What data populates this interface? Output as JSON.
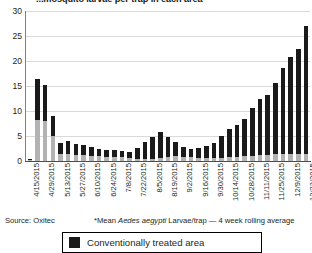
{
  "chart_data": {
    "type": "bar",
    "title": "...mosquito larvae per trap in each area",
    "subtitle": "",
    "xlabel": "",
    "ylabel": "",
    "ylim": [
      0,
      30
    ],
    "yticks": [
      0,
      5,
      10,
      15,
      20,
      25,
      30
    ],
    "grid": true,
    "stacked": true,
    "legend_position": "bottom",
    "bar_color_conventional": "#1a1a1a",
    "bar_color_treated": "#b3b3b3",
    "categories": [
      "4/15/2015",
      "4/22/2015",
      "4/29/2015",
      "5/6/2015",
      "5/13/2015",
      "5/20/2015",
      "5/27/2015",
      "6/3/2015",
      "6/10/2015",
      "6/17/2015",
      "6/24/2015",
      "7/1/2015",
      "7/8/2015",
      "7/15/2015",
      "7/22/2015",
      "7/29/2015",
      "8/5/2015",
      "8/12/2015",
      "8/19/2015",
      "8/26/2015",
      "9/2/2015",
      "9/9/2015",
      "9/16/2015",
      "9/23/2015",
      "9/30/2015",
      "10/7/2015",
      "10/14/2015",
      "10/21/2015",
      "10/28/2015",
      "11/4/2015",
      "11/11/2015",
      "11/18/2015",
      "11/25/2015",
      "12/2/2015",
      "12/9/2015",
      "12/16/2015",
      "12/23/2015"
    ],
    "tick_labels_shown": [
      "4/15/2015",
      "4/29/2015",
      "5/13/2015",
      "5/27/2015",
      "6/10/2015",
      "6/24/2015",
      "7/8/2015",
      "7/22/2015",
      "8/5/2015",
      "8/19/2015",
      "9/2/2015",
      "9/16/2015",
      "9/30/2015",
      "10/14/2015",
      "10/28/2015",
      "11/11/2015",
      "11/25/2015",
      "12/9/2015",
      "12/23/2015"
    ],
    "series": [
      {
        "name": "Oxitec treated area",
        "color": "#b3b3b3",
        "values": [
          0.2,
          8.2,
          8.0,
          5.0,
          1.4,
          1.4,
          1.3,
          1.3,
          1.1,
          1.0,
          0.9,
          0.9,
          0.8,
          0.6,
          0.5,
          0.5,
          0.5,
          0.6,
          0.8,
          1.0,
          0.9,
          0.8,
          0.7,
          0.6,
          0.6,
          0.7,
          0.8,
          0.9,
          1.0,
          1.1,
          1.2,
          1.3,
          1.4,
          1.4,
          1.5,
          1.4,
          1.5
        ]
      },
      {
        "name": "Conventionally treated area",
        "color": "#1a1a1a",
        "values": [
          0.2,
          8.2,
          7.3,
          4.0,
          2.2,
          2.7,
          2.2,
          1.9,
          1.7,
          1.5,
          1.4,
          1.3,
          1.2,
          1.2,
          2.1,
          3.3,
          4.3,
          5.2,
          4.1,
          2.9,
          2.0,
          1.7,
          2.0,
          2.5,
          3.0,
          4.3,
          5.6,
          6.4,
          7.4,
          9.6,
          11.3,
          12.0,
          14.2,
          17.2,
          19.3,
          21.0,
          25.5
        ]
      }
    ],
    "totals": [
      0.4,
      16.4,
      15.3,
      9.0,
      3.6,
      4.1,
      3.5,
      3.2,
      2.8,
      2.5,
      2.3,
      2.2,
      2.0,
      1.8,
      2.6,
      3.8,
      4.8,
      5.8,
      4.9,
      3.9,
      2.9,
      2.5,
      2.7,
      3.1,
      3.6,
      5.0,
      6.4,
      7.3,
      8.4,
      10.7,
      12.5,
      13.3,
      15.6,
      18.6,
      20.8,
      22.4,
      27.0
    ]
  },
  "footer": {
    "source": "Source: Oxitec",
    "method_prefix": "*Mean ",
    "method_italic": "Aedes aegypti",
    "method_suffix": " Larvae/trap — 4 week rolling average"
  },
  "legend": {
    "items": [
      {
        "label": "Conventionally treated area",
        "color": "#1a1a1a"
      }
    ]
  }
}
